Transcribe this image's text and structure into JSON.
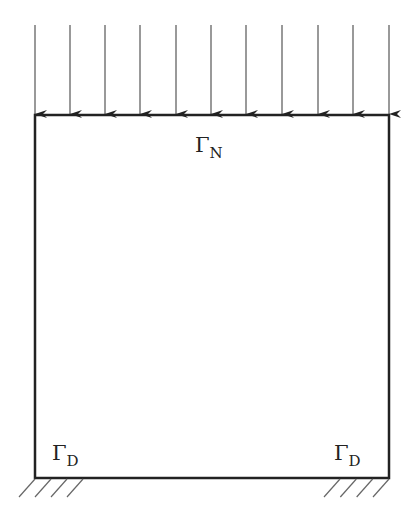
{
  "diagram": {
    "type": "boundary-value-problem-domain",
    "domain_box": {
      "left": 35,
      "top": 115,
      "right": 389,
      "bottom": 478
    },
    "load": {
      "description": "uniform downward distributed load on top edge",
      "arrow_x": [
        35,
        70,
        105,
        140,
        176,
        211,
        246,
        282,
        318,
        353,
        389
      ],
      "arrow_top_y": 25,
      "arrow_tip_y": 115
    },
    "labels": {
      "neumann": {
        "symbol": "Γ",
        "subscript": "N"
      },
      "dirichlet_left": {
        "symbol": "Γ",
        "subscript": "D"
      },
      "dirichlet_right": {
        "symbol": "Γ",
        "subscript": "D"
      }
    },
    "supports": {
      "left": {
        "x_start": 35,
        "x_end": 83,
        "y": 478,
        "hatches": 4
      },
      "right": {
        "x_start": 340,
        "x_end": 389,
        "y": 478,
        "hatches": 4
      }
    },
    "colors": {
      "line": "#222222",
      "arrow": "#555555"
    }
  }
}
